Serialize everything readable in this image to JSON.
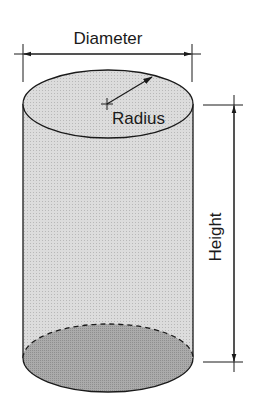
{
  "diagram": {
    "labels": {
      "diameter": "Diameter",
      "radius": "Radius",
      "height": "Height"
    },
    "colors": {
      "side_fill": "#d4d4d4",
      "top_fill": "#d0d0d0",
      "bottom_fill": "#a6a6a6",
      "stroke": "#1a1a1a"
    }
  }
}
